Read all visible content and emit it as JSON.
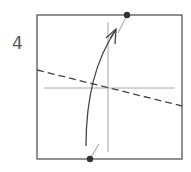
{
  "diagram": {
    "type": "origami-fold-step",
    "step_number": "4",
    "colors": {
      "paper_edge": "#555555",
      "crease": "#a8a8a8",
      "dashed_fold": "#444444",
      "arrow": "#444444",
      "dot": "#333333",
      "background": "#ffffff"
    },
    "square": {
      "x": 37,
      "y": 15,
      "width": 145,
      "height": 144
    },
    "points": {
      "top_dot": {
        "x": 127,
        "y": 15
      },
      "bottom_dot": {
        "x": 90,
        "y": 159
      }
    },
    "creases": [
      {
        "name": "vertical-crease",
        "x1": 108,
        "y1": 22,
        "x2": 108,
        "y2": 152
      },
      {
        "name": "horizontal-crease",
        "x1": 44,
        "y1": 88,
        "x2": 175,
        "y2": 88
      }
    ],
    "fold_line": {
      "style": "dashed",
      "x1": 37,
      "y1": 70,
      "x2": 182,
      "y2": 106
    },
    "arrow": {
      "from": "bottom_dot",
      "to": "top_dot",
      "curve": "valley-fold"
    }
  }
}
